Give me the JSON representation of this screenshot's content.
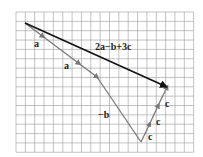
{
  "diagram": {
    "type": "vector-addition-on-grid",
    "grid": {
      "x0": 16,
      "y0": 12,
      "cols": 19,
      "rows": 15,
      "spacing": 9.35,
      "color": "#9a9a9a"
    },
    "points": {
      "start": [
        25,
        23
      ],
      "after_a1": [
        61,
        50
      ],
      "after_a2": [
        97,
        77
      ],
      "bottom": [
        141,
        142
      ],
      "end": [
        167,
        87
      ]
    },
    "vectors": [
      {
        "label": "a",
        "from": "start",
        "to": "after_a1",
        "color": "#7a7a7a"
      },
      {
        "label": "a",
        "from": "after_a1",
        "to": "after_a2",
        "color": "#7a7a7a"
      },
      {
        "label": "−b",
        "from": "after_a2",
        "to": "bottom",
        "color": "#7a7a7a"
      },
      {
        "label": "c",
        "segment": 1,
        "color": "#7a7a7a"
      },
      {
        "label": "c",
        "segment": 2,
        "color": "#7a7a7a"
      },
      {
        "label": "c",
        "segment": 3,
        "color": "#7a7a7a"
      },
      {
        "label": "2a−b+3c",
        "from": "start",
        "to": "end",
        "color": "#111111"
      }
    ],
    "labels": {
      "a1": "a",
      "a2": "a",
      "neg_b": "−b",
      "c1": "c",
      "c2": "c",
      "c3": "c",
      "resultant": "2a−b+3c"
    }
  }
}
